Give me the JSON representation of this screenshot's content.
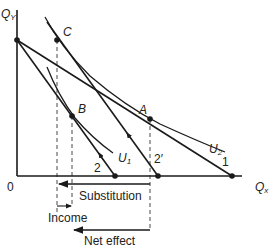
{
  "diagram": {
    "axes": {
      "y_label": "Q",
      "y_sub": "Y",
      "x_label": "Q",
      "x_sub": "x",
      "origin": "0"
    },
    "points": {
      "A": "A",
      "B": "B",
      "C": "C"
    },
    "curves": {
      "U1": "U",
      "U1_sub": "1",
      "U2": "U",
      "U2_sub": "2"
    },
    "budget_lines": {
      "line1": "1",
      "line2": "2",
      "line2prime": "2′"
    },
    "effects": {
      "substitution": "Substitution",
      "income": "Income",
      "net": "Net effect"
    },
    "colors": {
      "line": "#1a1a1a",
      "background": "#ffffff"
    }
  }
}
